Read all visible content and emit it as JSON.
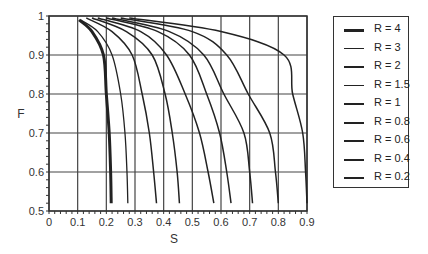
{
  "chart_data": {
    "type": "line",
    "title": "",
    "xlabel": "S",
    "ylabel": "F",
    "xlim": [
      0,
      0.9
    ],
    "ylim": [
      0.5,
      1
    ],
    "grid": true,
    "legend_position": "right",
    "x_ticks": [
      "0",
      "0.1",
      "0.2",
      "0.3",
      "0.4",
      "0.5",
      "0.6",
      "0.7",
      "0.8",
      "0.9"
    ],
    "y_ticks": [
      "0.5",
      "0.6",
      "0.7",
      "0.8",
      "0.9",
      "1"
    ],
    "series": [
      {
        "name": "R = 4",
        "width": 3.0,
        "points": [
          [
            0.105,
            0.99
          ],
          [
            0.15,
            0.96
          ],
          [
            0.19,
            0.9
          ],
          [
            0.2,
            0.8
          ],
          [
            0.21,
            0.7
          ],
          [
            0.215,
            0.6
          ],
          [
            0.217,
            0.52
          ]
        ]
      },
      {
        "name": "R = 3",
        "width": 1.3,
        "points": [
          [
            0.11,
            0.99
          ],
          [
            0.17,
            0.96
          ],
          [
            0.22,
            0.9
          ],
          [
            0.25,
            0.8
          ],
          [
            0.265,
            0.7
          ],
          [
            0.272,
            0.6
          ],
          [
            0.275,
            0.52
          ]
        ]
      },
      {
        "name": "R = 2",
        "width": 1.5,
        "points": [
          [
            0.13,
            0.995
          ],
          [
            0.22,
            0.96
          ],
          [
            0.29,
            0.9
          ],
          [
            0.325,
            0.8
          ],
          [
            0.35,
            0.7
          ],
          [
            0.365,
            0.6
          ],
          [
            0.375,
            0.52
          ]
        ]
      },
      {
        "name": "R = 1.5",
        "width": 1.5,
        "points": [
          [
            0.15,
            0.995
          ],
          [
            0.27,
            0.96
          ],
          [
            0.36,
            0.9
          ],
          [
            0.405,
            0.8
          ],
          [
            0.43,
            0.7
          ],
          [
            0.447,
            0.6
          ],
          [
            0.455,
            0.52
          ]
        ]
      },
      {
        "name": "R = 1",
        "width": 1.5,
        "points": [
          [
            0.17,
            0.995
          ],
          [
            0.32,
            0.96
          ],
          [
            0.41,
            0.9
          ],
          [
            0.475,
            0.8
          ],
          [
            0.525,
            0.7
          ],
          [
            0.555,
            0.6
          ],
          [
            0.575,
            0.52
          ]
        ]
      },
      {
        "name": "R = 0.8",
        "width": 1.5,
        "points": [
          [
            0.2,
            0.995
          ],
          [
            0.38,
            0.96
          ],
          [
            0.49,
            0.9
          ],
          [
            0.55,
            0.8
          ],
          [
            0.595,
            0.7
          ],
          [
            0.62,
            0.6
          ],
          [
            0.635,
            0.52
          ]
        ]
      },
      {
        "name": "R = 0.6",
        "width": 1.5,
        "points": [
          [
            0.22,
            0.995
          ],
          [
            0.42,
            0.96
          ],
          [
            0.54,
            0.9
          ],
          [
            0.61,
            0.8
          ],
          [
            0.68,
            0.7
          ],
          [
            0.7,
            0.6
          ],
          [
            0.71,
            0.52
          ]
        ]
      },
      {
        "name": "R = 0.4",
        "width": 1.5,
        "points": [
          [
            0.25,
            0.995
          ],
          [
            0.5,
            0.96
          ],
          [
            0.62,
            0.9
          ],
          [
            0.695,
            0.8
          ],
          [
            0.77,
            0.7
          ],
          [
            0.79,
            0.6
          ],
          [
            0.8,
            0.52
          ]
        ]
      },
      {
        "name": "R = 0.2",
        "width": 1.5,
        "points": [
          [
            0.28,
            0.995
          ],
          [
            0.6,
            0.96
          ],
          [
            0.82,
            0.9
          ],
          [
            0.85,
            0.8
          ],
          [
            0.885,
            0.7
          ],
          [
            0.895,
            0.6
          ],
          [
            0.9,
            0.52
          ]
        ]
      }
    ],
    "colors": {
      "line": "#222222",
      "grid": "#444444",
      "axis": "#333333"
    }
  },
  "legend": {
    "items": [
      {
        "label": "R = 4",
        "width": 3
      },
      {
        "label": "R = 3",
        "width": 1
      },
      {
        "label": "R = 2",
        "width": 1.5
      },
      {
        "label": "R = 1.5",
        "width": 1.5
      },
      {
        "label": "R = 1",
        "width": 2
      },
      {
        "label": "R = 0.8",
        "width": 2
      },
      {
        "label": "R = 0.6",
        "width": 2
      },
      {
        "label": "R = 0.4",
        "width": 2
      },
      {
        "label": "R = 0.2",
        "width": 1.5
      }
    ]
  }
}
